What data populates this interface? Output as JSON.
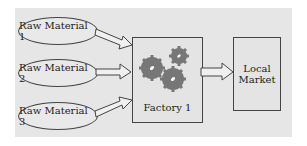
{
  "diagram": {
    "inputs": [
      {
        "label": "Raw Material 1"
      },
      {
        "label": "Raw Material 2"
      },
      {
        "label": "Raw Material 3"
      }
    ],
    "factory": {
      "label": "Factory 1",
      "icon": "gears-icon"
    },
    "output": {
      "label_line1": "Local",
      "label_line2": "Market"
    },
    "colors": {
      "background": "#e6e6e6",
      "gear": "#777777",
      "stroke": "#444444"
    }
  }
}
